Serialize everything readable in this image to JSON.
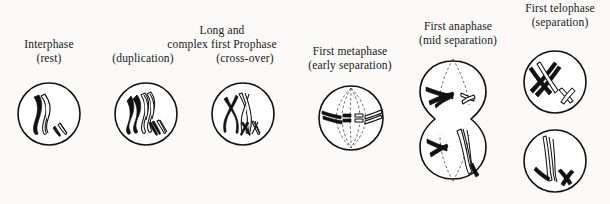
{
  "figure": {
    "type": "biological-process-diagram",
    "background_color": "#fbfaf8",
    "ink_color": "#111111"
  },
  "stages": [
    {
      "id": "interphase",
      "name": "Interphase",
      "heading": "Interphase",
      "subheading": "(rest)",
      "caption_lines": [
        "Interphase",
        "(rest)"
      ],
      "cell_shape": "single-circle",
      "chromosome_count_visible": 4,
      "description": "Long thin unduplicated chromosome threads, one long pair and one short pair"
    },
    {
      "id": "prophase-duplication",
      "name": "First Prophase (duplication)",
      "heading": "Long and",
      "heading_line2": "complex first Prophase",
      "subheading": "(duplication)",
      "caption_lines": [
        "Long and",
        "complex first Prophase",
        "(duplication)"
      ],
      "cell_shape": "single-circle",
      "chromosome_count_visible": 4,
      "description": "Chromosomes duplicated, dark paternal and light maternal strands lie side by side"
    },
    {
      "id": "prophase-crossover",
      "name": "First Prophase (cross-over)",
      "heading": "Long and",
      "heading_line2": "complex first Prophase",
      "subheading": "(cross-over)",
      "caption_lines": [
        "Long and",
        "complex first Prophase",
        "(cross-over)"
      ],
      "cell_shape": "single-circle",
      "chromosome_count_visible": 4,
      "description": "Homologous chromosomes cross over forming X shaped chiasmata"
    },
    {
      "id": "metaphase",
      "name": "First metaphase",
      "heading": "First metaphase",
      "subheading": "(early separation)",
      "caption_lines": [
        "First metaphase",
        "(early separation)"
      ],
      "cell_shape": "single-circle-with-spindle",
      "chromosome_count_visible": 4,
      "spindle": true,
      "description": "Spindle formed, chromosome pairs aligned on the equatorial plate"
    },
    {
      "id": "anaphase",
      "name": "First anaphase",
      "heading": "First anaphase",
      "subheading": "(mid separation)",
      "caption_lines": [
        "First anaphase",
        "(mid separation)"
      ],
      "cell_shape": "dumbbell",
      "chromosome_count_visible": 4,
      "spindle": true,
      "description": "Cell constricting, chromosomes drawn to opposite poles"
    },
    {
      "id": "telophase",
      "name": "First telophase",
      "heading": "First telophase",
      "subheading": "(separation)",
      "caption_lines": [
        "First telophase",
        "(separation)"
      ],
      "cell_shape": "two-separate-circles",
      "chromosome_count_visible": 4,
      "description": "Two daughter cells fully separated, each with one long and one short chromosome"
    }
  ],
  "legend": {
    "dark_chromosome": "paternal chromosome (solid black)",
    "light_chromosome": "maternal chromosome (outlined)"
  }
}
